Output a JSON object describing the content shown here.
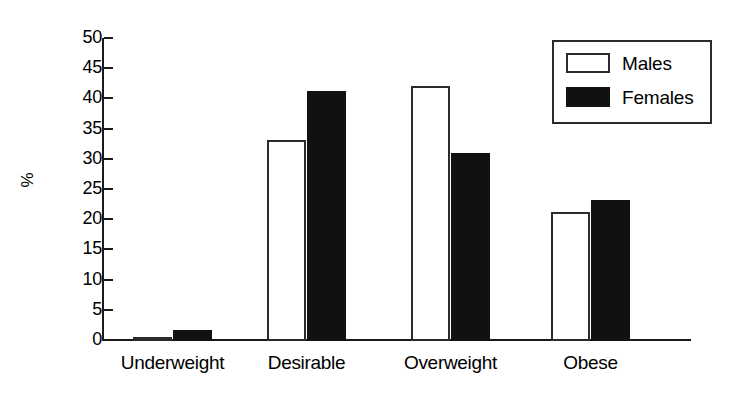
{
  "chart_data": {
    "type": "bar",
    "title": "",
    "xlabel": "",
    "ylabel": "%",
    "categories": [
      "Underweight",
      "Desirable",
      "Overweight",
      "Obese"
    ],
    "series": [
      {
        "name": "Males",
        "values": [
          0.7,
          33.3,
          42.3,
          21.3
        ],
        "color": "#ffffff",
        "edge_color": "#2b2b2b"
      },
      {
        "name": "Females",
        "values": [
          1.8,
          41.4,
          31.2,
          23.4
        ],
        "color": "#111111",
        "edge_color": "#111111"
      }
    ],
    "ylim": [
      0,
      50
    ],
    "yticks": [
      0,
      5,
      10,
      15,
      20,
      25,
      30,
      35,
      40,
      45,
      50
    ],
    "ytick_labels": [
      "0",
      "5",
      "10",
      "15",
      "20",
      "25",
      "30",
      "35",
      "40",
      "45",
      "50"
    ],
    "grid": false,
    "legend_position": "top-right",
    "legend_entries": [
      "Males",
      "Females"
    ]
  },
  "axis": {
    "y_title": "%"
  },
  "legend": {
    "males_label": "Males",
    "females_label": "Females"
  }
}
